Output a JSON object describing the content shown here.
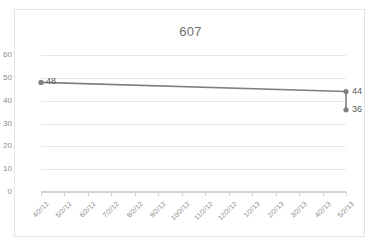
{
  "chart_data": {
    "type": "line",
    "title": "607",
    "xlabel": "",
    "ylabel": "",
    "ylim": [
      0,
      60
    ],
    "ytick_step": 10,
    "yticks": [
      0,
      10,
      20,
      30,
      40,
      50,
      60
    ],
    "grid": true,
    "legend": false,
    "categories": [
      "4/2/12",
      "5/2/12",
      "6/2/12",
      "7/2/12",
      "8/2/12",
      "9/2/12",
      "10/2/12",
      "11/2/12",
      "12/2/12",
      "1/2/13",
      "2/2/13",
      "3/2/13",
      "4/2/13",
      "5/2/13"
    ],
    "series": [
      {
        "name": "607",
        "values": [
          48,
          null,
          null,
          null,
          null,
          null,
          null,
          null,
          null,
          null,
          null,
          null,
          null,
          44
        ],
        "color": "#808080"
      },
      {
        "name": "607-drop",
        "values": [
          null,
          null,
          null,
          null,
          null,
          null,
          null,
          null,
          null,
          null,
          null,
          null,
          null,
          36
        ],
        "color": "#808080"
      }
    ],
    "point_labels": [
      {
        "text": "48",
        "category": "4/2/12",
        "value": 48
      },
      {
        "text": "44",
        "category": "5/2/13",
        "value": 44
      },
      {
        "text": "36",
        "category": "5/2/13",
        "value": 36
      }
    ],
    "markers": [
      {
        "category": "4/2/12",
        "value": 48
      },
      {
        "category": "5/2/13",
        "value": 44
      },
      {
        "category": "5/2/13",
        "value": 36
      }
    ]
  },
  "colors": {
    "line": "#808080",
    "gridline": "#e8e8e8",
    "axis": "#d2d2d2",
    "tick_text": "#8a8a8a",
    "title_text": "#6f6f6f",
    "label_text": "#5a5a5a",
    "border": "#e3e3e3",
    "background": "#ffffff"
  }
}
